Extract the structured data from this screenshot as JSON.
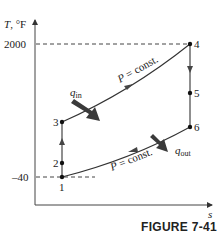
{
  "figure": {
    "caption": "FIGURE 7-41",
    "axes": {
      "y_label_T": "T",
      "y_label_unit": ", °F",
      "x_label": "s",
      "y_ticks": [
        {
          "label": "2000",
          "value": 2000
        },
        {
          "label": "–40",
          "value": -40
        }
      ]
    },
    "states": [
      {
        "id": "1",
        "label": "1"
      },
      {
        "id": "2",
        "label": "2"
      },
      {
        "id": "3",
        "label": "3"
      },
      {
        "id": "4",
        "label": "4"
      },
      {
        "id": "5",
        "label": "5"
      },
      {
        "id": "6",
        "label": "6"
      }
    ],
    "processes": {
      "high_pressure_label": "P = const.",
      "low_pressure_label": "P = const."
    },
    "heat": {
      "q_in_main": "q",
      "q_in_sub": "in",
      "q_out_main": "q",
      "q_out_sub": "out"
    },
    "colors": {
      "line": "#333333",
      "arrow_fill": "#3a3a3a",
      "dash": "#444444"
    }
  }
}
